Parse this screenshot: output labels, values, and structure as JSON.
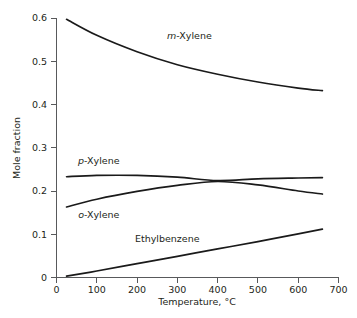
{
  "chart_data": {
    "type": "line",
    "title": "",
    "xlabel": "Temperature, °C",
    "ylabel": "Mole fraction",
    "xlim": [
      0,
      700
    ],
    "ylim": [
      0,
      0.6
    ],
    "grid": false,
    "legend_position": "inline-curve-labels",
    "xticks": [
      "0",
      "100",
      "200",
      "300",
      "400",
      "500",
      "600",
      "700"
    ],
    "xtick_values": [
      0,
      100,
      200,
      300,
      400,
      500,
      600,
      700
    ],
    "yticks": [
      "0",
      "0.1",
      "0.2",
      "0.3",
      "0.4",
      "0.5",
      "0.6"
    ],
    "ytick_values": [
      0,
      0.1,
      0.2,
      0.3,
      0.4,
      0.5,
      0.6
    ],
    "x": [
      25,
      100,
      200,
      300,
      400,
      500,
      600,
      660
    ],
    "series": [
      {
        "name": "m-Xylene",
        "name_italic_prefix": "m",
        "name_rest": "-Xylene",
        "values": [
          0.597,
          0.56,
          0.522,
          0.492,
          0.47,
          0.452,
          0.438,
          0.432
        ],
        "label_x": 330,
        "label_y": 0.552
      },
      {
        "name": "p-Xylene",
        "name_italic_prefix": "p",
        "name_rest": "-Xylene",
        "values": [
          0.233,
          0.236,
          0.236,
          0.232,
          0.224,
          0.228,
          0.23,
          0.231
        ],
        "label_x": 105,
        "label_y": 0.262
      },
      {
        "name": "o-Xylene",
        "name_italic_prefix": "o",
        "name_rest": "-Xylene",
        "values": [
          0.163,
          0.181,
          0.199,
          0.213,
          0.222,
          0.214,
          0.2,
          0.193
        ],
        "label_x": 105,
        "label_y": 0.137
      },
      {
        "name": "Ethylbenzene",
        "name_italic_prefix": "",
        "name_rest": "Ethylbenzene",
        "values": [
          0.003,
          0.015,
          0.032,
          0.049,
          0.066,
          0.083,
          0.101,
          0.112
        ],
        "label_x": 275,
        "label_y": 0.083
      }
    ]
  },
  "axes": {
    "y_title": "Mole fraction",
    "x_title": "Temperature, °C",
    "x_tick_labels": [
      "0",
      "100",
      "200",
      "300",
      "400",
      "500",
      "600",
      "700"
    ],
    "y_tick_labels": [
      "0",
      "0.1",
      "0.2",
      "0.3",
      "0.4",
      "0.5",
      "0.6"
    ]
  },
  "colors": {
    "curve": "#1a1a1a",
    "axis": "#58595b",
    "text": "#231f20",
    "background": "#ffffff"
  }
}
